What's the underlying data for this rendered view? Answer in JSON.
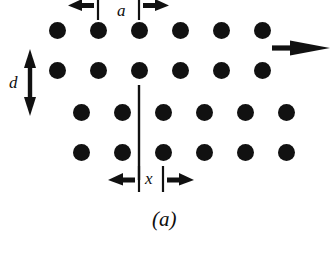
{
  "figure": {
    "caption": "(a)",
    "background_color": "#ffffff",
    "atom_color": "#111111",
    "line_color": "#111111",
    "width": 334,
    "height": 267
  },
  "labels": {
    "lattice_spacing": "a",
    "row_spacing": "d",
    "shift": "x"
  },
  "annotations": {
    "shear_arrow": "right-arrow",
    "slip_plane": "vertical-line",
    "dimension_a": "horizontal-dimension-outward-arrows",
    "dimension_d": "vertical-double-headed-arrow",
    "dimension_x": "horizontal-dimension-outward-arrows"
  },
  "chart_data": {
    "type": "scatter",
    "title": "(a)",
    "xlabel": "",
    "ylabel": "",
    "grid": false,
    "legend": "none",
    "atom_radius_px": 8.5,
    "column_spacing_a_px": 41,
    "row_spacing_d_px": 40,
    "shift_x_px": 24,
    "series": [
      {
        "name": "upper-row-1",
        "y": 30,
        "x": [
          57,
          98,
          139,
          180,
          221,
          262
        ]
      },
      {
        "name": "upper-row-2",
        "y": 70,
        "x": [
          57,
          98,
          139,
          180,
          221,
          262
        ]
      },
      {
        "name": "lower-row-3",
        "y": 112,
        "x": [
          81,
          122,
          163,
          204,
          245,
          286
        ]
      },
      {
        "name": "lower-row-4",
        "y": 152,
        "x": [
          81,
          122,
          163,
          204,
          245,
          286
        ]
      }
    ],
    "markers": {
      "slip_plane_line": {
        "x": 139,
        "y_top": 85,
        "y_bottom": 180
      },
      "shear_arrow": {
        "x_start": 272,
        "x_end": 330,
        "y": 48
      },
      "dimension_a": {
        "x_left": 98,
        "x_right": 139,
        "y": 6
      },
      "dimension_d": {
        "x": 30,
        "y_top": 59,
        "y_bottom": 106
      },
      "dimension_x": {
        "x_left": 139,
        "x_right": 163,
        "y": 180
      }
    },
    "label_positions": {
      "a": {
        "x": 117,
        "y": 2
      },
      "d": {
        "x": 9,
        "y": 74
      },
      "x": {
        "x": 145,
        "y": 170
      },
      "caption": {
        "x": 152,
        "y": 207
      }
    }
  }
}
